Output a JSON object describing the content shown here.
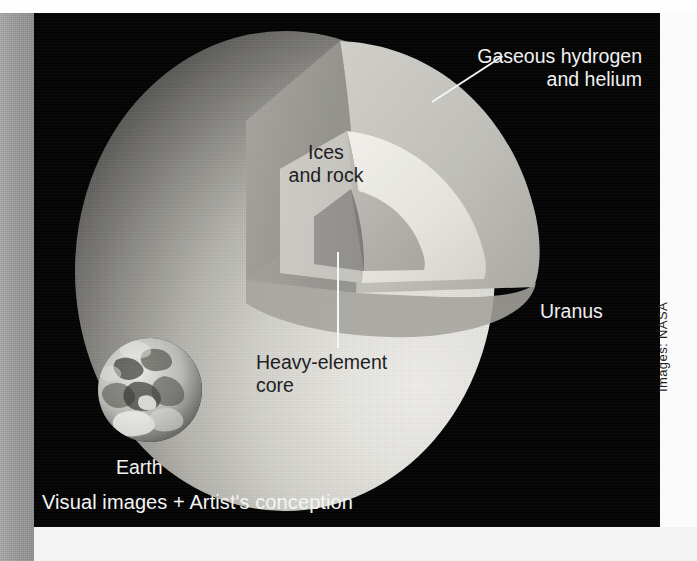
{
  "figure": {
    "background_color": "#050505",
    "caption": "Visual images + Artist's conception",
    "credit": "Images: NASA",
    "labels": {
      "gaseous": "Gaseous hydrogen\nand helium",
      "ices": "Ices\nand rock",
      "core": "Heavy-element\ncore",
      "planet": "Uranus",
      "scale_body": "Earth"
    },
    "layers": [
      {
        "name": "Gaseous hydrogen and helium",
        "fill": "#b9b8b2",
        "order": 1
      },
      {
        "name": "Ices and rock",
        "fill": "#e4e3dd",
        "order": 2
      },
      {
        "name": "Heavy-element core",
        "fill": "#b0afa9",
        "order": 3
      }
    ],
    "colors": {
      "plate": "#050505",
      "gutter": "#9b9b9b",
      "paper": "#f3f3f3",
      "label_light": "#f2f2f2",
      "label_dark": "#18181a",
      "leader": "#f6f6f6"
    }
  }
}
